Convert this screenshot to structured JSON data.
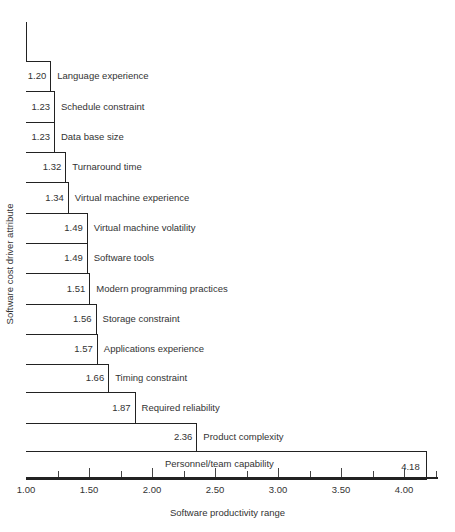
{
  "chart_data": {
    "type": "bar",
    "orientation": "horizontal",
    "title": "",
    "xlabel": "Software productivity range",
    "ylabel": "Software cost driver attribute",
    "xlim": [
      1.0,
      4.25
    ],
    "x_ticks": [
      "1.00",
      "1.50",
      "2.00",
      "2.50",
      "3.00",
      "3.50",
      "4.00"
    ],
    "minor_tick_step": 0.25,
    "grid": false,
    "legend": null,
    "categories": [
      "Language experience",
      "Schedule constraint",
      "Data base size",
      "Turnaround time",
      "Virtual machine experience",
      "Virtual machine volatility",
      "Software tools",
      "Modern programming practices",
      "Storage constraint",
      "Applications experience",
      "Timing constraint",
      "Required reliability",
      "Product complexity",
      "Personnel/team capability"
    ],
    "values": [
      1.2,
      1.23,
      1.23,
      1.32,
      1.34,
      1.49,
      1.49,
      1.51,
      1.56,
      1.57,
      1.66,
      1.87,
      2.36,
      4.18
    ],
    "value_labels": [
      "1.20",
      "1.23",
      "1.23",
      "1.32",
      "1.34",
      "1.49",
      "1.49",
      "1.51",
      "1.56",
      "1.57",
      "1.66",
      "1.87",
      "2.36",
      "4.18"
    ]
  },
  "colors": {
    "ink": "#222222",
    "background": "#ffffff"
  }
}
